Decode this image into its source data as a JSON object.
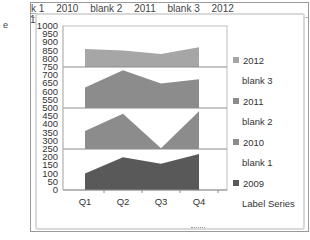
{
  "sheet": {
    "left_edge_text": "e",
    "row_stub": "1",
    "series_header": [
      "k 1",
      "2010",
      "blank 2",
      "2011",
      "blank 3",
      "2012"
    ]
  },
  "chart_data": {
    "type": "area",
    "subtype": "stacked-panel area (each series offset into its own 250-unit band)",
    "title": "",
    "xlabel": "",
    "ylabel": "",
    "categories": [
      "Q1",
      "Q2",
      "Q3",
      "Q4"
    ],
    "ylim": [
      0,
      1000
    ],
    "y_ticks": [
      0,
      50,
      100,
      150,
      200,
      250,
      300,
      350,
      400,
      450,
      500,
      550,
      600,
      650,
      700,
      750,
      800,
      850,
      900,
      950,
      1000
    ],
    "band_separators": [
      250,
      500,
      750
    ],
    "series": [
      {
        "name": "2009",
        "band_base": 0,
        "values": [
          100,
          200,
          160,
          220
        ],
        "color": "#595959"
      },
      {
        "name": "2010",
        "band_base": 250,
        "values": [
          110,
          215,
          5,
          230
        ],
        "color": "#8c8c8c"
      },
      {
        "name": "2011",
        "band_base": 500,
        "values": [
          125,
          230,
          150,
          175
        ],
        "color": "#8c8c8c"
      },
      {
        "name": "2012",
        "band_base": 750,
        "values": [
          110,
          100,
          80,
          120
        ],
        "color": "#a6a6a6"
      }
    ],
    "legend": {
      "position": "right",
      "entries": [
        "2012",
        "blank 3",
        "2011",
        "blank 2",
        "2010",
        "blank 1",
        "2009",
        "Label Series"
      ]
    },
    "grid": false
  },
  "legend": {
    "items": [
      {
        "label": "2012",
        "swatch": true,
        "color": "#a6a6a6"
      },
      {
        "label": "blank 3",
        "swatch": false
      },
      {
        "label": "2011",
        "swatch": true,
        "color": "#8c8c8c"
      },
      {
        "label": "blank 2",
        "swatch": false
      },
      {
        "label": "2010",
        "swatch": true,
        "color": "#8c8c8c"
      },
      {
        "label": "blank 1",
        "swatch": false
      },
      {
        "label": "2009",
        "swatch": true,
        "color": "#595959"
      },
      {
        "label": "Label Series",
        "swatch": false
      }
    ]
  }
}
